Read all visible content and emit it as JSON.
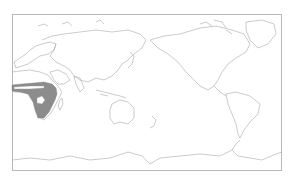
{
  "map": {
    "projection": "equirectangular, Pacific-centered",
    "frame_color": "#b8b8b8",
    "coastline_color": "#a8a8a8",
    "range_fill_color": "#8c8c8c",
    "background_color": "#ffffff",
    "highlighted_region": "Sub-Saharan Africa",
    "legend": null,
    "title": null
  }
}
